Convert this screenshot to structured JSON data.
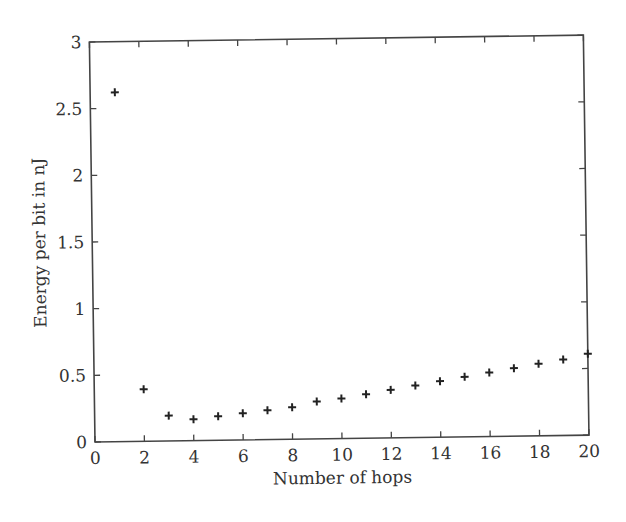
{
  "chart_data": {
    "type": "scatter",
    "title": "",
    "xlabel": "Number of hops",
    "ylabel": "Energy per bit in nJ",
    "xlim": [
      0,
      20
    ],
    "ylim": [
      0,
      3
    ],
    "xticks": [
      0,
      2,
      4,
      6,
      8,
      10,
      12,
      14,
      16,
      18,
      20
    ],
    "yticks": [
      0,
      0.5,
      1,
      1.5,
      2,
      2.5,
      3
    ],
    "xtick_labels": [
      "0",
      "2",
      "4",
      "6",
      "8",
      "10",
      "12",
      "14",
      "16",
      "18",
      "20"
    ],
    "ytick_labels": [
      "0",
      "0.5",
      "1",
      "1.5",
      "2",
      "2.5",
      "3"
    ],
    "grid": false,
    "legend": null,
    "marker": "+",
    "marker_color": "#222222",
    "series": [
      {
        "name": "Energy per bit",
        "x": [
          1,
          2,
          3,
          4,
          5,
          6,
          7,
          8,
          9,
          10,
          11,
          12,
          13,
          14,
          15,
          16,
          17,
          18,
          19,
          20
        ],
        "y": [
          2.62,
          0.39,
          0.19,
          0.16,
          0.18,
          0.2,
          0.22,
          0.24,
          0.28,
          0.3,
          0.33,
          0.36,
          0.39,
          0.42,
          0.45,
          0.48,
          0.51,
          0.54,
          0.57,
          0.61
        ]
      }
    ]
  }
}
